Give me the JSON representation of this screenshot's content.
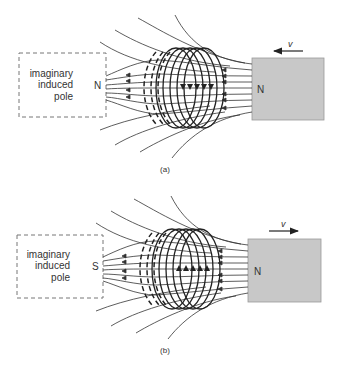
{
  "panels": [
    {
      "id": "a",
      "caption": "(a)",
      "induced_pole": {
        "line1": "imaginary",
        "line2": "induced",
        "line3": "pole",
        "letter": "N"
      },
      "magnet": {
        "pole": "N",
        "velocity_label": "v",
        "direction": "left"
      },
      "coil_arrow_direction": "down"
    },
    {
      "id": "b",
      "caption": "(b)",
      "induced_pole": {
        "line1": "imaginary",
        "line2": "induced",
        "line3": "pole",
        "letter": "S"
      },
      "magnet": {
        "pole": "N",
        "velocity_label": "v",
        "direction": "right"
      },
      "coil_arrow_direction": "up"
    }
  ],
  "colors": {
    "magnet_fill": "#c8c8c8",
    "line": "#333333",
    "dash": "#777777"
  }
}
